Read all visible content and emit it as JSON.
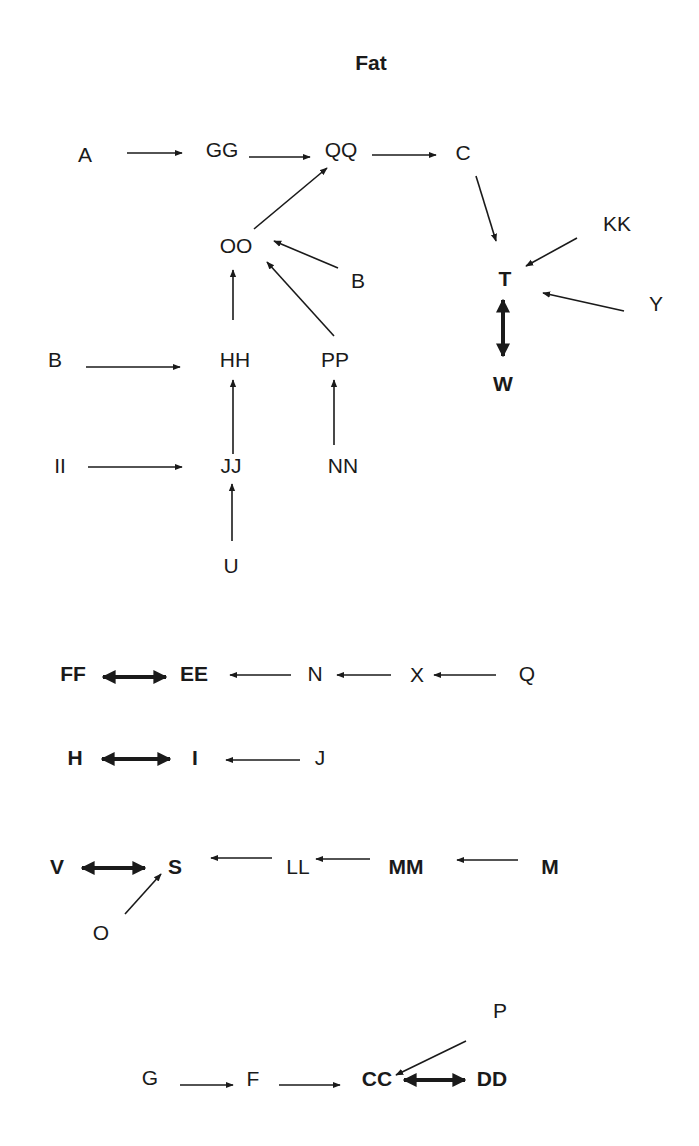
{
  "title": {
    "text": "Fat",
    "x": 371,
    "y": 70
  },
  "colors": {
    "ink": "#1a1a1a",
    "background": "#ffffff"
  },
  "nodes": [
    {
      "id": "A",
      "label": "A",
      "x": 85,
      "y": 162,
      "bold": false
    },
    {
      "id": "GG",
      "label": "GG",
      "x": 222,
      "y": 157,
      "bold": false
    },
    {
      "id": "QQ",
      "label": "QQ",
      "x": 341,
      "y": 157,
      "bold": false
    },
    {
      "id": "C",
      "label": "C",
      "x": 463,
      "y": 160,
      "bold": false
    },
    {
      "id": "OO",
      "label": "OO",
      "x": 236,
      "y": 253,
      "bold": false
    },
    {
      "id": "B1",
      "label": "B",
      "x": 358,
      "y": 288,
      "bold": false
    },
    {
      "id": "KK",
      "label": "KK",
      "x": 617,
      "y": 231,
      "bold": false
    },
    {
      "id": "T",
      "label": "T",
      "x": 505,
      "y": 286,
      "bold": true
    },
    {
      "id": "Y",
      "label": "Y",
      "x": 656,
      "y": 311,
      "bold": false
    },
    {
      "id": "W",
      "label": "W",
      "x": 503,
      "y": 391,
      "bold": true
    },
    {
      "id": "B2",
      "label": "B",
      "x": 55,
      "y": 367,
      "bold": false
    },
    {
      "id": "HH",
      "label": "HH",
      "x": 235,
      "y": 367,
      "bold": false
    },
    {
      "id": "PP",
      "label": "PP",
      "x": 335,
      "y": 367,
      "bold": false
    },
    {
      "id": "II",
      "label": "II",
      "x": 60,
      "y": 473,
      "bold": false
    },
    {
      "id": "JJ",
      "label": "JJ",
      "x": 231,
      "y": 473,
      "bold": false
    },
    {
      "id": "NN",
      "label": "NN",
      "x": 343,
      "y": 473,
      "bold": false
    },
    {
      "id": "U",
      "label": "U",
      "x": 231,
      "y": 573,
      "bold": false
    },
    {
      "id": "FF",
      "label": "FF",
      "x": 73,
      "y": 681,
      "bold": true
    },
    {
      "id": "EE",
      "label": "EE",
      "x": 194,
      "y": 681,
      "bold": true
    },
    {
      "id": "N",
      "label": "N",
      "x": 315,
      "y": 681,
      "bold": false
    },
    {
      "id": "X",
      "label": "X",
      "x": 417,
      "y": 682,
      "bold": false
    },
    {
      "id": "Q",
      "label": "Q",
      "x": 527,
      "y": 681,
      "bold": false
    },
    {
      "id": "H",
      "label": "H",
      "x": 75,
      "y": 765,
      "bold": true
    },
    {
      "id": "I",
      "label": "I",
      "x": 195,
      "y": 765,
      "bold": true
    },
    {
      "id": "J",
      "label": "J",
      "x": 320,
      "y": 765,
      "bold": false
    },
    {
      "id": "V",
      "label": "V",
      "x": 57,
      "y": 874,
      "bold": true
    },
    {
      "id": "S",
      "label": "S",
      "x": 175,
      "y": 874,
      "bold": true
    },
    {
      "id": "LL",
      "label": "LL",
      "x": 298,
      "y": 874,
      "bold": false
    },
    {
      "id": "MM",
      "label": "MM",
      "x": 406,
      "y": 874,
      "bold": true
    },
    {
      "id": "M",
      "label": "M",
      "x": 550,
      "y": 874,
      "bold": true
    },
    {
      "id": "O",
      "label": "O",
      "x": 101,
      "y": 940,
      "bold": false
    },
    {
      "id": "P",
      "label": "P",
      "x": 500,
      "y": 1018,
      "bold": false
    },
    {
      "id": "G",
      "label": "G",
      "x": 150,
      "y": 1085,
      "bold": false
    },
    {
      "id": "F",
      "label": "F",
      "x": 253,
      "y": 1086,
      "bold": false
    },
    {
      "id": "CC",
      "label": "CC",
      "x": 377,
      "y": 1086,
      "bold": true
    },
    {
      "id": "DD",
      "label": "DD",
      "x": 492,
      "y": 1086,
      "bold": true
    }
  ],
  "edges": [
    {
      "from": "A",
      "to": "GG",
      "x1": 127,
      "y1": 153,
      "x2": 182,
      "y2": 153,
      "type": "single"
    },
    {
      "from": "GG",
      "to": "QQ",
      "x1": 249,
      "y1": 157,
      "x2": 310,
      "y2": 157,
      "type": "single"
    },
    {
      "from": "QQ",
      "to": "C",
      "x1": 372,
      "y1": 155,
      "x2": 436,
      "y2": 155,
      "type": "single"
    },
    {
      "from": "OO",
      "to": "QQ",
      "x1": 254,
      "y1": 229,
      "x2": 327,
      "y2": 168,
      "type": "single"
    },
    {
      "from": "C",
      "to": "T",
      "x1": 476,
      "y1": 176,
      "x2": 496,
      "y2": 241,
      "type": "single"
    },
    {
      "from": "KK",
      "to": "T",
      "x1": 577,
      "y1": 238,
      "x2": 526,
      "y2": 266,
      "type": "single"
    },
    {
      "from": "Y",
      "to": "T",
      "x1": 624,
      "y1": 311,
      "x2": 543,
      "y2": 293,
      "type": "single"
    },
    {
      "from": "T",
      "to": "W",
      "x1": 503,
      "y1": 300,
      "x2": 503,
      "y2": 356,
      "type": "double"
    },
    {
      "from": "B1",
      "to": "OO",
      "x1": 338,
      "y1": 268,
      "x2": 274,
      "y2": 241,
      "type": "single"
    },
    {
      "from": "HH",
      "to": "OO",
      "x1": 233,
      "y1": 320,
      "x2": 233,
      "y2": 270,
      "type": "single"
    },
    {
      "from": "PP",
      "to": "OO",
      "x1": 334,
      "y1": 336,
      "x2": 267,
      "y2": 262,
      "type": "single"
    },
    {
      "from": "B2",
      "to": "HH",
      "x1": 86,
      "y1": 367,
      "x2": 180,
      "y2": 367,
      "type": "single"
    },
    {
      "from": "JJ",
      "to": "HH",
      "x1": 233,
      "y1": 454,
      "x2": 233,
      "y2": 380,
      "type": "single"
    },
    {
      "from": "NN",
      "to": "PP",
      "x1": 334,
      "y1": 445,
      "x2": 334,
      "y2": 380,
      "type": "single"
    },
    {
      "from": "II",
      "to": "JJ",
      "x1": 88,
      "y1": 467,
      "x2": 182,
      "y2": 467,
      "type": "single"
    },
    {
      "from": "U",
      "to": "JJ",
      "x1": 232,
      "y1": 541,
      "x2": 232,
      "y2": 484,
      "type": "single"
    },
    {
      "from": "FF",
      "to": "EE",
      "x1": 103,
      "y1": 677,
      "x2": 166,
      "y2": 677,
      "type": "double"
    },
    {
      "from": "N",
      "to": "EE",
      "x1": 291,
      "y1": 675,
      "x2": 230,
      "y2": 675,
      "type": "single"
    },
    {
      "from": "X",
      "to": "N",
      "x1": 391,
      "y1": 675,
      "x2": 337,
      "y2": 675,
      "type": "single"
    },
    {
      "from": "Q",
      "to": "X",
      "x1": 496,
      "y1": 675,
      "x2": 434,
      "y2": 675,
      "type": "single"
    },
    {
      "from": "H",
      "to": "I",
      "x1": 102,
      "y1": 759,
      "x2": 170,
      "y2": 759,
      "type": "double"
    },
    {
      "from": "J",
      "to": "I",
      "x1": 300,
      "y1": 760,
      "x2": 226,
      "y2": 760,
      "type": "single"
    },
    {
      "from": "V",
      "to": "S",
      "x1": 82,
      "y1": 868,
      "x2": 145,
      "y2": 868,
      "type": "double"
    },
    {
      "from": "LL",
      "to": "S",
      "x1": 272,
      "y1": 858,
      "x2": 211,
      "y2": 858,
      "type": "single"
    },
    {
      "from": "MM",
      "to": "LL",
      "x1": 370,
      "y1": 859,
      "x2": 316,
      "y2": 859,
      "type": "single"
    },
    {
      "from": "M",
      "to": "MM",
      "x1": 518,
      "y1": 860,
      "x2": 457,
      "y2": 860,
      "type": "single"
    },
    {
      "from": "O",
      "to": "S",
      "x1": 125,
      "y1": 914,
      "x2": 161,
      "y2": 874,
      "type": "single"
    },
    {
      "from": "P",
      "to": "CC",
      "x1": 466,
      "y1": 1041,
      "x2": 396,
      "y2": 1075,
      "type": "single"
    },
    {
      "from": "G",
      "to": "F",
      "x1": 180,
      "y1": 1085,
      "x2": 233,
      "y2": 1085,
      "type": "single"
    },
    {
      "from": "F",
      "to": "CC",
      "x1": 279,
      "y1": 1085,
      "x2": 340,
      "y2": 1085,
      "type": "single"
    },
    {
      "from": "CC",
      "to": "DD",
      "x1": 404,
      "y1": 1080,
      "x2": 465,
      "y2": 1080,
      "type": "double"
    }
  ]
}
